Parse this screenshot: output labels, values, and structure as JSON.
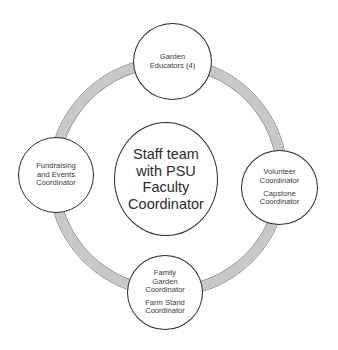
{
  "diagram": {
    "type": "hub-and-ring org diagram",
    "colors": {
      "ring_fill": "#c8c8c8",
      "ring_border": "#8a8a8a",
      "node_border": "#2a2a2a",
      "node_fill": "#ffffff",
      "text": "#333333",
      "background": "#ffffff"
    },
    "center": {
      "lines": [
        "Staff team",
        "with PSU",
        "Faculty",
        "Coordinator"
      ]
    },
    "nodes": {
      "top": {
        "groups": [
          {
            "lines": [
              "Garden",
              "Educators (4)"
            ]
          }
        ]
      },
      "left": {
        "groups": [
          {
            "lines": [
              "Fundraising",
              "and Events",
              "Coordinator"
            ]
          }
        ]
      },
      "right": {
        "groups": [
          {
            "lines": [
              "Volunteer",
              "Coordinator"
            ]
          },
          {
            "lines": [
              "Capstone",
              "Coordinator"
            ]
          }
        ]
      },
      "bottom": {
        "groups": [
          {
            "lines": [
              "Family",
              "Garden",
              "Coordinator"
            ]
          },
          {
            "lines": [
              "Farm Stand",
              "Coordinator"
            ]
          }
        ]
      }
    }
  }
}
